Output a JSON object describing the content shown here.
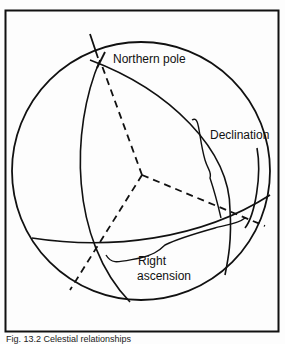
{
  "figure": {
    "labels": {
      "northern_pole": "Northern pole",
      "declination": "Declination",
      "right_ascension_line1": "Right",
      "right_ascension_line2": "ascension"
    },
    "caption": "Fig. 13.2 Celestial relationships",
    "colors": {
      "ink": "#111111",
      "paper": "#fdfdfd"
    }
  }
}
